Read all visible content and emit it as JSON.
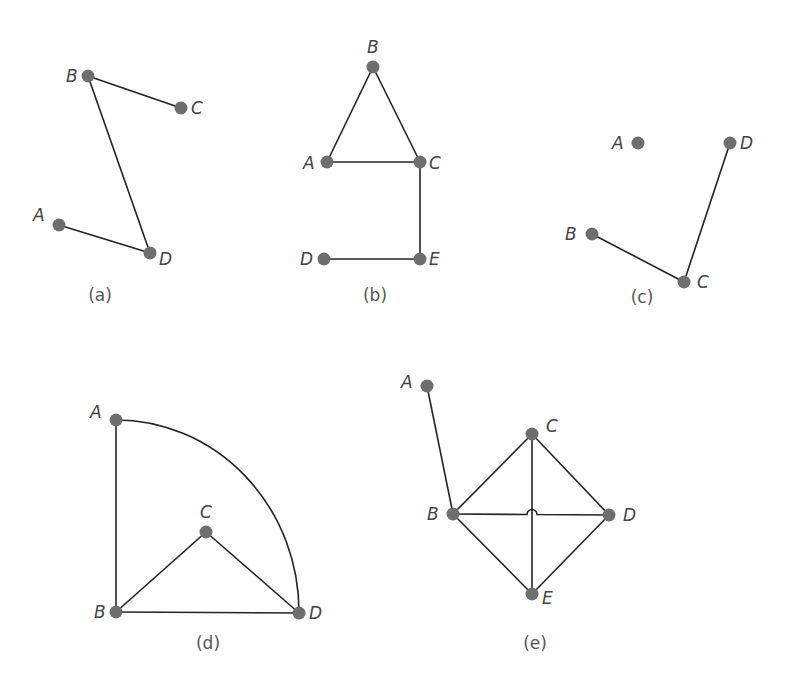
{
  "figure": {
    "graphs": [
      {
        "id": "a",
        "caption": "(a)",
        "caption_pos": [
          100,
          301
        ],
        "vertices": [
          {
            "name": "A",
            "x": 59,
            "y": 225,
            "label_dx": -26,
            "label_dy": -4
          },
          {
            "name": "B",
            "x": 88,
            "y": 76,
            "label_dx": -22,
            "label_dy": 6
          },
          {
            "name": "C",
            "x": 181,
            "y": 108,
            "label_dx": 10,
            "label_dy": 6
          },
          {
            "name": "D",
            "x": 150,
            "y": 253,
            "label_dx": 9,
            "label_dy": 12
          }
        ],
        "edges": [
          [
            "B",
            "C"
          ],
          [
            "B",
            "D"
          ],
          [
            "A",
            "D"
          ]
        ]
      },
      {
        "id": "b",
        "caption": "(b)",
        "caption_pos": [
          375,
          301
        ],
        "vertices": [
          {
            "name": "A",
            "x": 327,
            "y": 162,
            "label_dx": -24,
            "label_dy": 7
          },
          {
            "name": "B",
            "x": 373,
            "y": 67,
            "label_dx": -6,
            "label_dy": -14
          },
          {
            "name": "C",
            "x": 420,
            "y": 162,
            "label_dx": 9,
            "label_dy": 7
          },
          {
            "name": "D",
            "x": 324,
            "y": 259,
            "label_dx": -24,
            "label_dy": 6
          },
          {
            "name": "E",
            "x": 420,
            "y": 259,
            "label_dx": 9,
            "label_dy": 6
          }
        ],
        "edges": [
          [
            "A",
            "B"
          ],
          [
            "B",
            "C"
          ],
          [
            "A",
            "C"
          ],
          [
            "C",
            "E"
          ],
          [
            "D",
            "E"
          ]
        ]
      },
      {
        "id": "c",
        "caption": "(c)",
        "caption_pos": [
          642,
          303
        ],
        "vertices": [
          {
            "name": "A",
            "x": 638,
            "y": 143,
            "label_dx": -26,
            "label_dy": 6
          },
          {
            "name": "B",
            "x": 592,
            "y": 234,
            "label_dx": -27,
            "label_dy": 6
          },
          {
            "name": "C",
            "x": 684,
            "y": 282,
            "label_dx": 13,
            "label_dy": 6
          },
          {
            "name": "D",
            "x": 730,
            "y": 143,
            "label_dx": 10,
            "label_dy": 6
          }
        ],
        "edges": [
          [
            "B",
            "C"
          ],
          [
            "C",
            "D"
          ]
        ]
      },
      {
        "id": "d",
        "caption": "(d)",
        "caption_pos": [
          208,
          649
        ],
        "vertices": [
          {
            "name": "A",
            "x": 116,
            "y": 420,
            "label_dx": -26,
            "label_dy": -2
          },
          {
            "name": "B",
            "x": 116,
            "y": 612,
            "label_dx": -22,
            "label_dy": 6
          },
          {
            "name": "C",
            "x": 206,
            "y": 532,
            "label_dx": -6,
            "label_dy": -14
          },
          {
            "name": "D",
            "x": 299,
            "y": 613,
            "label_dx": 10,
            "label_dy": 6
          }
        ],
        "edges": [
          [
            "A",
            "B"
          ],
          [
            "B",
            "C"
          ],
          [
            "C",
            "D"
          ],
          [
            "B",
            "D"
          ]
        ],
        "curved_edges": [
          {
            "from": "A",
            "to": "D",
            "center": "B",
            "shape": "quarter-arc"
          }
        ]
      },
      {
        "id": "e",
        "caption": "(e)",
        "caption_pos": [
          535,
          649
        ],
        "vertices": [
          {
            "name": "A",
            "x": 427,
            "y": 386,
            "label_dx": -26,
            "label_dy": 2
          },
          {
            "name": "B",
            "x": 453,
            "y": 514,
            "label_dx": -26,
            "label_dy": 6
          },
          {
            "name": "C",
            "x": 532,
            "y": 434,
            "label_dx": 14,
            "label_dy": -2
          },
          {
            "name": "D",
            "x": 609,
            "y": 515,
            "label_dx": 14,
            "label_dy": 6
          },
          {
            "name": "E",
            "x": 532,
            "y": 594,
            "label_dx": 10,
            "label_dy": 10
          }
        ],
        "edges": [
          [
            "A",
            "B"
          ],
          [
            "B",
            "C"
          ],
          [
            "C",
            "D"
          ],
          [
            "D",
            "E"
          ],
          [
            "B",
            "E"
          ],
          [
            "C",
            "E"
          ]
        ],
        "hop_edges": [
          {
            "from": "B",
            "to": "D",
            "hop_x": 532,
            "hop_radius": 5
          }
        ]
      }
    ],
    "colors": {
      "vertex": "#6e6e6e",
      "edge": "#232323",
      "label": "#444444",
      "background": "#ffffff"
    }
  }
}
